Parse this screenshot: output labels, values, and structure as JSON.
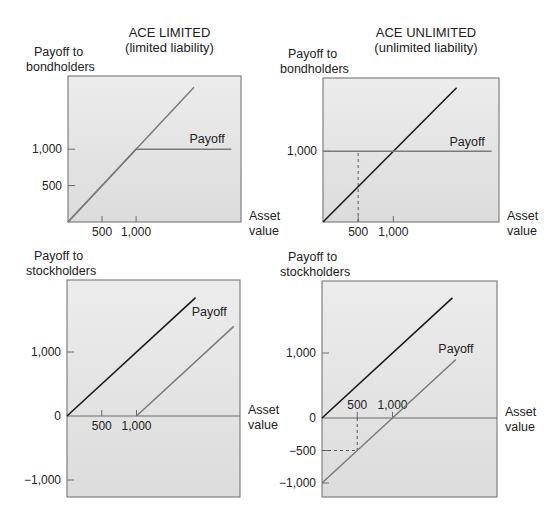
{
  "colors": {
    "background": "#ffffff",
    "panel_fill_top": "#ececec",
    "panel_fill_bottom": "#dcdcdc",
    "border": "#6a6a6a",
    "asset_line": "#1a1a1a",
    "payoff_line": "#7a7a7a",
    "dashed": "#555555"
  },
  "chart_data": [
    {
      "id": "limited-bondholders",
      "type": "line",
      "column_title": "ACE LIMITED",
      "column_subtitle": "(limited liability)",
      "ylabel": [
        "Payoff to",
        "bondholders"
      ],
      "xlabel": [
        "Asset",
        "value"
      ],
      "x_ticks": [
        500,
        1000
      ],
      "x_tick_labels": [
        "500",
        "1,000"
      ],
      "y_ticks": [
        500,
        1000
      ],
      "y_tick_labels": [
        "500",
        "1,000"
      ],
      "series": [
        {
          "name": "Asset value (45° line)",
          "style": "payoff_line",
          "x": [
            0,
            1850
          ],
          "y": [
            0,
            1850
          ]
        },
        {
          "name": "Payoff",
          "style": "payoff_line",
          "x": [
            0,
            1000,
            2400
          ],
          "y": [
            0,
            1000,
            1000
          ]
        }
      ],
      "annotation": {
        "text": "Payoff",
        "x": 2300,
        "y": 1080
      },
      "xlim": [
        0,
        2400
      ],
      "ylim": [
        0,
        2000
      ],
      "px": {
        "left": 68,
        "top": 76,
        "right": 241,
        "bottom": 222,
        "x0": 68,
        "y0": 222,
        "x_per_unit": 0.0681,
        "y_per_unit": 0.0728
      }
    },
    {
      "id": "unlimited-bondholders",
      "type": "line",
      "column_title": "ACE UNLIMITED",
      "column_subtitle": "(unlimited liability)",
      "ylabel": [
        "Payoff to",
        "bondholders"
      ],
      "xlabel": [
        "Asset",
        "value"
      ],
      "x_ticks": [
        500,
        1000
      ],
      "x_tick_labels": [
        "500",
        "1,000"
      ],
      "y_ticks": [
        1000
      ],
      "y_tick_labels": [
        "1,000"
      ],
      "series": [
        {
          "name": "Asset value",
          "style": "asset_line",
          "x": [
            0,
            1900
          ],
          "y": [
            0,
            1900
          ]
        },
        {
          "name": "Payoff",
          "style": "payoff_line",
          "x": [
            0,
            2400
          ],
          "y": [
            1000,
            1000
          ]
        }
      ],
      "dashed_guides": [
        {
          "x": [
            500,
            500
          ],
          "y": [
            0,
            1000
          ]
        }
      ],
      "annotation": {
        "text": "Payoff",
        "x": 2300,
        "y": 1080
      },
      "xlim": [
        0,
        2400
      ],
      "ylim": [
        0,
        2000
      ],
      "px": {
        "left": 323,
        "top": 78,
        "right": 499,
        "bottom": 222,
        "x0": 323,
        "y0": 222,
        "x_per_unit": 0.0703,
        "y_per_unit": 0.0707
      }
    },
    {
      "id": "limited-stockholders",
      "type": "line",
      "ylabel": [
        "Payoff to",
        "stockholders"
      ],
      "xlabel": [
        "Asset",
        "value"
      ],
      "x_ticks": [
        500,
        1000
      ],
      "x_tick_labels": [
        "500",
        "1,000"
      ],
      "y_ticks": [
        1000,
        0,
        -1000
      ],
      "y_tick_labels": [
        "1,000",
        "0",
        "−1,000"
      ],
      "series": [
        {
          "name": "Asset value",
          "style": "asset_line",
          "x": [
            0,
            1850
          ],
          "y": [
            0,
            1850
          ]
        },
        {
          "name": "Payoff",
          "style": "payoff_line",
          "x": [
            1000,
            2400
          ],
          "y": [
            0,
            1400
          ]
        }
      ],
      "annotation": {
        "text": "Payoff",
        "x": 2300,
        "y": 1560
      },
      "xlim": [
        0,
        2400
      ],
      "ylim": [
        -1200,
        2150
      ],
      "px": {
        "left": 67,
        "top": 280,
        "right": 240,
        "bottom": 497,
        "x0": 67,
        "y0": 416,
        "x_per_unit": 0.0695,
        "y_per_unit": 0.064
      }
    },
    {
      "id": "unlimited-stockholders",
      "type": "line",
      "ylabel": [
        "Payoff to",
        "stockholders"
      ],
      "xlabel": [
        "Asset",
        "value"
      ],
      "x_ticks": [
        500,
        1000
      ],
      "x_tick_labels": [
        "500",
        "1,000"
      ],
      "y_ticks": [
        1000,
        0,
        -500,
        -1000
      ],
      "y_tick_labels": [
        "1,000",
        "0",
        "−500",
        "−1,000"
      ],
      "series": [
        {
          "name": "Asset value",
          "style": "asset_line",
          "x": [
            0,
            1850
          ],
          "y": [
            0,
            1850
          ]
        },
        {
          "name": "Payoff",
          "style": "payoff_line",
          "x": [
            0,
            1900
          ],
          "y": [
            -1000,
            900
          ]
        }
      ],
      "dashed_guides": [
        {
          "x": [
            500,
            500
          ],
          "y": [
            0,
            -500
          ]
        },
        {
          "x": [
            0,
            500
          ],
          "y": [
            -500,
            -500
          ]
        }
      ],
      "annotation": {
        "text": "Payoff",
        "x": 2150,
        "y": 1000
      },
      "xlim": [
        0,
        2400
      ],
      "ylim": [
        -1200,
        2100
      ],
      "px": {
        "left": 322,
        "top": 281,
        "right": 497,
        "bottom": 497,
        "x0": 322,
        "y0": 418,
        "x_per_unit": 0.0705,
        "y_per_unit": 0.065
      }
    }
  ]
}
